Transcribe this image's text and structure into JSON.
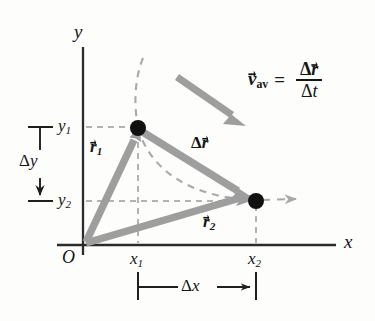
{
  "figure": {
    "type": "physics-vector-diagram",
    "background": "#fdfdfb",
    "colors": {
      "axis": "#2b2b2b",
      "vector": "#9a9a9a",
      "vector_dark": "#8d8d8d",
      "dashed_path": "#a9a9a9",
      "gridline": "#9b9b9b",
      "point": "#111111",
      "text": "#151515"
    }
  },
  "axes": {
    "x_axis_label": "x",
    "y_axis_label": "y",
    "origin_label": "O",
    "x_axis_y_px": 245,
    "y_axis_x_px": 83
  },
  "ticks": {
    "y1_label": "y",
    "y1_sub": "1",
    "y2_label": "y",
    "y2_sub": "2",
    "x1_label": "x",
    "x1_sub": "1",
    "x2_label": "x",
    "x2_sub": "2"
  },
  "points": [
    {
      "name": "point-1",
      "x_label": "x1",
      "y_label": "y1",
      "px": 138,
      "py": 128
    },
    {
      "name": "point-2",
      "x_label": "x2",
      "y_label": "y2",
      "px": 256,
      "py": 201
    }
  ],
  "vectors": [
    {
      "name": "r1",
      "base": "r",
      "sub": "1",
      "from": [
        85,
        243
      ],
      "to": [
        138,
        128
      ],
      "label_px": [
        92,
        141
      ]
    },
    {
      "name": "r2",
      "base": "r",
      "sub": "2",
      "from": [
        85,
        243
      ],
      "to": [
        256,
        201
      ],
      "label_px": [
        205,
        216
      ]
    },
    {
      "name": "delta-r",
      "base": "r",
      "prefix": "Δ",
      "from": [
        138,
        128
      ],
      "to": [
        256,
        201
      ],
      "label_px": [
        193,
        137
      ]
    },
    {
      "name": "v-av",
      "from": [
        177,
        77
      ],
      "to": [
        245,
        125
      ]
    }
  ],
  "equation": {
    "v_symbol": "v",
    "v_subscript": "av",
    "equals": "=",
    "numerator_delta": "Δ",
    "numerator_symbol": "r",
    "denominator_delta": "Δ",
    "denominator_symbol": "t"
  },
  "measurements": {
    "delta_y": {
      "delta": "Δ",
      "symbol": "y",
      "from_py": 127,
      "to_py": 201,
      "x_px": 40
    },
    "delta_x": {
      "delta": "Δ",
      "symbol": "x",
      "from_px": 138,
      "to_px": 256,
      "y_px": 287
    }
  },
  "path": {
    "name": "trajectory",
    "style": "dashed",
    "description": "curved dashed particle path passing through point 1 and point 2, continuing to the right with an arrowhead"
  }
}
